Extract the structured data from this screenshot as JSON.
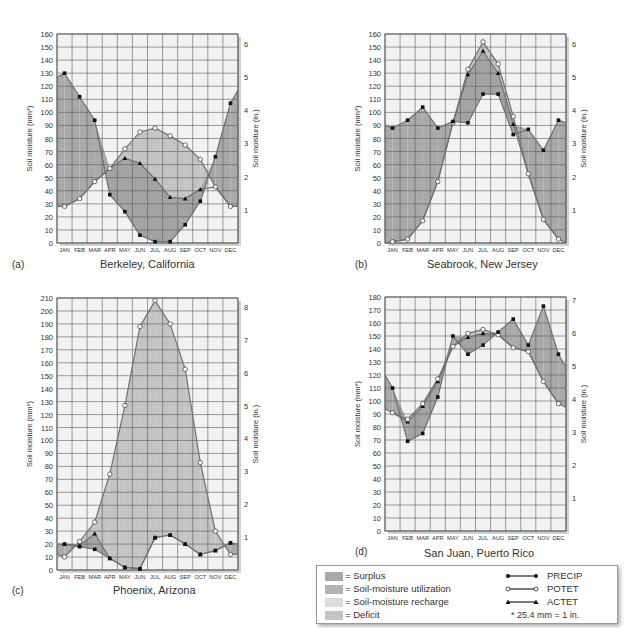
{
  "months": [
    "JAN",
    "FEB",
    "MAR",
    "APR",
    "MAY",
    "JUN",
    "JUL",
    "AUG",
    "SEP",
    "OCT",
    "NOV",
    "DEC"
  ],
  "colors": {
    "surplus": "#a9a9a9",
    "utilization": "#b3b3b3",
    "recharge": "#dcdcdc",
    "deficit": "#c4c4c4",
    "plot_bg": "#f2f2f2",
    "grid": "#5a5a5a",
    "line": "#707070",
    "marker": "#111111"
  },
  "legend": {
    "areas": [
      {
        "key": "surplus",
        "label": "= Surplus"
      },
      {
        "key": "utilization",
        "label": "= Soil-moisture utilization"
      },
      {
        "key": "recharge",
        "label": "= Soil-moisture recharge"
      },
      {
        "key": "deficit",
        "label": "= Deficit"
      }
    ],
    "lines": [
      {
        "key": "precip",
        "label": "PRECIP",
        "marker": "filled-circle"
      },
      {
        "key": "potet",
        "label": "POTET",
        "marker": "open-circle"
      },
      {
        "key": "actet",
        "label": "ACTET",
        "marker": "filled-triangle"
      }
    ],
    "note": "* 25.4 mm = 1 in."
  },
  "chart_data": [
    {
      "id": "a",
      "type": "line",
      "panel_label": "(a)",
      "title": "Berkeley, California",
      "ylabel": "Soil moisture (mm*)",
      "ylabel_right": "Soil moisture (in.)",
      "ylim": [
        0,
        160
      ],
      "ystep": 10,
      "right_ticks": [
        1,
        2,
        3,
        4,
        5,
        6
      ],
      "categories": [
        "JAN",
        "FEB",
        "MAR",
        "APR",
        "MAY",
        "JUN",
        "JUL",
        "AUG",
        "SEP",
        "OCT",
        "NOV",
        "DEC"
      ],
      "series": [
        {
          "name": "PRECIP",
          "values": [
            130,
            112,
            94,
            37,
            24,
            6,
            1,
            1,
            14,
            32,
            66,
            107
          ]
        },
        {
          "name": "POTET",
          "values": [
            28,
            34,
            47,
            57,
            72,
            85,
            88,
            82,
            75,
            64,
            43,
            28
          ]
        },
        {
          "name": "ACTET",
          "values": [
            28,
            34,
            47,
            57,
            65,
            61,
            49,
            35,
            34,
            41,
            43,
            28
          ]
        }
      ],
      "edge_left": {
        "precip": 127,
        "potet": 28
      },
      "edge_right": {
        "precip": 117,
        "potet": 28
      },
      "box": {
        "x": 57,
        "y": 34,
        "w": 181,
        "h": 209
      },
      "title_pos": {
        "x": 100,
        "y": 258
      },
      "panel_pos": {
        "x": 12,
        "y": 259
      }
    },
    {
      "id": "b",
      "type": "line",
      "panel_label": "(b)",
      "title": "Seabrook, New Jersey",
      "ylabel": "Soil moisture (mm*)",
      "ylabel_right": "Soil moisture (in.)",
      "ylim": [
        0,
        160
      ],
      "ystep": 10,
      "right_ticks": [
        1,
        2,
        3,
        4,
        5,
        6
      ],
      "categories": [
        "JAN",
        "FEB",
        "MAR",
        "APR",
        "MAY",
        "JUN",
        "JUL",
        "AUG",
        "SEP",
        "OCT",
        "NOV",
        "DEC"
      ],
      "series": [
        {
          "name": "PRECIP",
          "values": [
            88,
            94,
            104,
            88,
            93,
            92,
            114,
            114,
            83,
            87,
            71,
            94
          ]
        },
        {
          "name": "POTET",
          "values": [
            1,
            3,
            17,
            47,
            92,
            133,
            154,
            137,
            97,
            53,
            18,
            3
          ]
        },
        {
          "name": "ACTET",
          "values": [
            1,
            3,
            17,
            47,
            92,
            129,
            147,
            130,
            91,
            53,
            18,
            3
          ]
        }
      ],
      "edge_left": {
        "precip": 90,
        "potet": 0
      },
      "edge_right": {
        "precip": 92,
        "potet": 0
      },
      "box": {
        "x": 385,
        "y": 34,
        "w": 181,
        "h": 209
      },
      "title_pos": {
        "x": 427,
        "y": 258
      },
      "panel_pos": {
        "x": 355,
        "y": 259
      }
    },
    {
      "id": "c",
      "type": "line",
      "panel_label": "(c)",
      "title": "Phoenix, Arizona",
      "ylabel": "Soil moisture (mm*)",
      "ylabel_right": "Soil moisture (in.)",
      "ylim": [
        0,
        210
      ],
      "ystep": 10,
      "right_ticks": [
        1,
        2,
        3,
        4,
        5,
        6,
        7,
        8
      ],
      "categories": [
        "JAN",
        "FEB",
        "MAR",
        "APR",
        "MAY",
        "JUN",
        "JUL",
        "AUG",
        "SEP",
        "OCT",
        "NOV",
        "DEC"
      ],
      "series": [
        {
          "name": "PRECIP",
          "values": [
            20,
            18,
            16,
            9,
            2,
            1,
            25,
            27,
            20,
            12,
            15,
            21
          ]
        },
        {
          "name": "POTET",
          "values": [
            10,
            22,
            37,
            74,
            127,
            188,
            208,
            190,
            155,
            83,
            30,
            12
          ]
        },
        {
          "name": "ACTET",
          "values": [
            20,
            19,
            28,
            9,
            2,
            1,
            25,
            27,
            20,
            12,
            15,
            21
          ]
        }
      ],
      "edge_left": {
        "precip": 20,
        "potet": 12
      },
      "edge_right": {
        "precip": 20,
        "potet": 12
      },
      "box": {
        "x": 57,
        "y": 298,
        "w": 181,
        "h": 272
      },
      "title_pos": {
        "x": 113,
        "y": 584
      },
      "panel_pos": {
        "x": 12,
        "y": 585
      }
    },
    {
      "id": "d",
      "type": "line",
      "panel_label": "(d)",
      "title": "San Juan, Puerto Rico",
      "ylabel": "Soil moisture (mm*)",
      "ylabel_right": "Soil moisture (in.)",
      "ylim": [
        0,
        180
      ],
      "ystep": 10,
      "right_ticks": [
        1,
        2,
        3,
        4,
        5,
        6,
        7
      ],
      "categories": [
        "JAN",
        "FEB",
        "MAR",
        "APR",
        "MAY",
        "JUN",
        "JUL",
        "AUG",
        "SEP",
        "OCT",
        "NOV",
        "DEC"
      ],
      "series": [
        {
          "name": "PRECIP",
          "values": [
            110,
            69,
            75,
            103,
            150,
            136,
            143,
            153,
            163,
            143,
            173,
            136
          ]
        },
        {
          "name": "POTET",
          "values": [
            91,
            86,
            98,
            117,
            142,
            152,
            155,
            151,
            141,
            138,
            115,
            98
          ]
        },
        {
          "name": "ACTET",
          "values": [
            91,
            84,
            96,
            115,
            142,
            149,
            152,
            151,
            141,
            138,
            115,
            98
          ]
        }
      ],
      "edge_left": {
        "precip": 120,
        "potet": 94
      },
      "edge_right": {
        "precip": 126,
        "potet": 95
      },
      "box": {
        "x": 385,
        "y": 297,
        "w": 181,
        "h": 234
      },
      "title_pos": {
        "x": 424,
        "y": 547
      },
      "panel_pos": {
        "x": 355,
        "y": 546
      }
    }
  ]
}
